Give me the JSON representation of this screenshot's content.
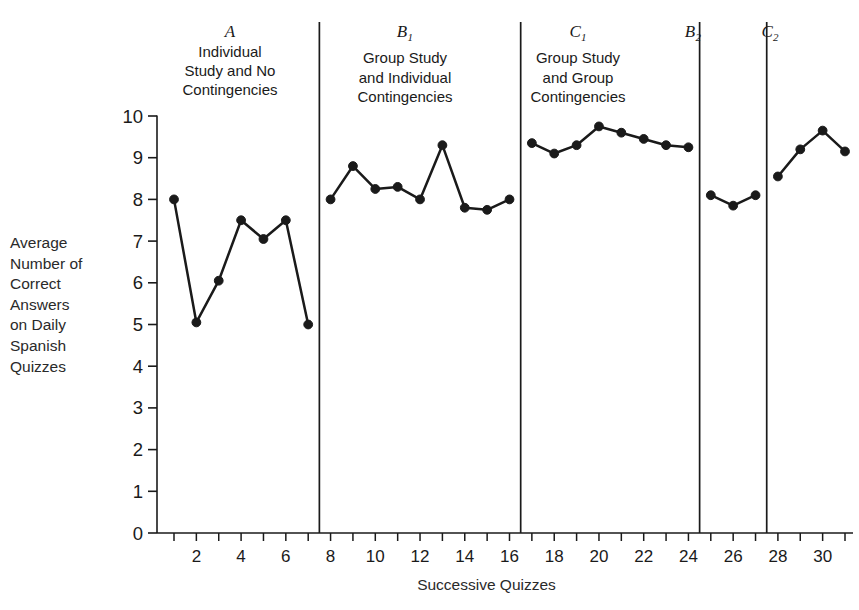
{
  "axes": {
    "ylabel_text": "Average\nNumber of\nCorrect\nAnswers\non Daily\nSpanish\nQuizzes",
    "xlabel_text": "Successive Quizzes",
    "yticks": [
      "0",
      "1",
      "2",
      "3",
      "4",
      "5",
      "6",
      "7",
      "8",
      "9",
      "10"
    ],
    "xticks_labeled": [
      "2",
      "4",
      "6",
      "8",
      "10",
      "12",
      "14",
      "16",
      "18",
      "20",
      "22",
      "24",
      "26",
      "28",
      "30"
    ],
    "ylim": [
      0,
      10
    ],
    "xlim": [
      0.4,
      31.6
    ],
    "tick_color": "#1a1a1a",
    "line_color": "#1a1a1a"
  },
  "phases": [
    {
      "id": "A",
      "letter": "A",
      "subscript": "",
      "desc": "Individual\nStudy and No\nContingencies",
      "left_px": 160,
      "width_px": 140,
      "top_px": 22
    },
    {
      "id": "B1",
      "letter": "B",
      "subscript": "1",
      "desc": "Group Study\nand Individual\nContingencies",
      "left_px": 335,
      "width_px": 140,
      "top_px": 22
    },
    {
      "id": "C1",
      "letter": "C",
      "subscript": "1",
      "desc": "Group Study\nand Group\nContingencies",
      "left_px": 508,
      "width_px": 140,
      "top_px": 22
    },
    {
      "id": "B2",
      "letter": "B",
      "subscript": "2",
      "desc": "",
      "left_px": 658,
      "width_px": 70,
      "top_px": 22
    },
    {
      "id": "C2",
      "letter": "C",
      "subscript": "2",
      "desc": "",
      "left_px": 735,
      "width_px": 70,
      "top_px": 22
    }
  ],
  "dividers": [
    7.5,
    16.5,
    24.5,
    27.5
  ],
  "chart_data": {
    "type": "line",
    "title": "",
    "xlabel": "Successive Quizzes",
    "ylabel": "Average Number of Correct Answers on Daily Spanish Quizzes",
    "xlim": [
      0.4,
      31.6
    ],
    "ylim": [
      0,
      10
    ],
    "grid": false,
    "legend": "none",
    "marker": "filled-circle",
    "phase_change_lines": [
      7.5,
      16.5,
      24.5,
      27.5
    ],
    "series": [
      {
        "name": "A - Individual Study and No Contingencies",
        "x": [
          1,
          2,
          3,
          4,
          5,
          6,
          7
        ],
        "values": [
          8.0,
          5.05,
          6.05,
          7.5,
          7.05,
          7.5,
          5.0
        ]
      },
      {
        "name": "B1 - Group Study and Individual Contingencies",
        "x": [
          8,
          9,
          10,
          11,
          12,
          13,
          14,
          15,
          16
        ],
        "values": [
          8.0,
          8.8,
          8.25,
          8.3,
          8.0,
          9.3,
          7.8,
          7.75,
          8.0
        ]
      },
      {
        "name": "C1 - Group Study and Group Contingencies",
        "x": [
          17,
          18,
          19,
          20,
          21,
          22,
          23,
          24
        ],
        "values": [
          9.35,
          9.1,
          9.3,
          9.75,
          9.6,
          9.45,
          9.3,
          9.25
        ]
      },
      {
        "name": "B2",
        "x": [
          25,
          26,
          27
        ],
        "values": [
          8.1,
          7.85,
          8.1
        ]
      },
      {
        "name": "C2",
        "x": [
          28,
          29,
          30,
          31
        ],
        "values": [
          8.55,
          9.2,
          9.65,
          9.15
        ]
      }
    ]
  }
}
